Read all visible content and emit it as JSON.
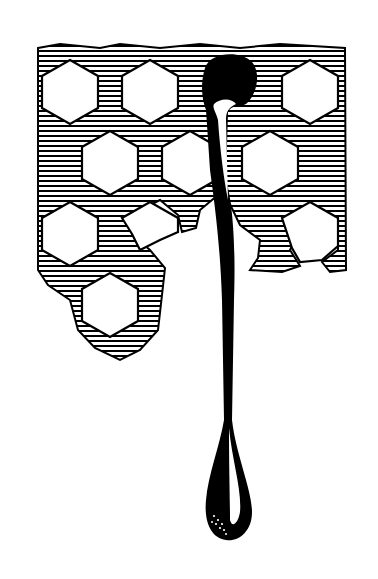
{
  "illustration": {
    "title": "Honeycomb with dripping drop",
    "subject": "hatched honeycomb grid with a black drop dripping down into a long teardrop",
    "colors": {
      "ink": "#000000",
      "paper": "#ffffff"
    },
    "cells": [
      {
        "row": 0,
        "cx": 70,
        "cy": 92
      },
      {
        "row": 0,
        "cx": 150,
        "cy": 92
      },
      {
        "row": 0,
        "cx": 310,
        "cy": 92
      },
      {
        "row": 1,
        "cx": 110,
        "cy": 163
      },
      {
        "row": 1,
        "cx": 190,
        "cy": 163
      },
      {
        "row": 1,
        "cx": 270,
        "cy": 163
      },
      {
        "row": 2,
        "cx": 70,
        "cy": 234
      },
      {
        "row": 3,
        "cx": 110,
        "cy": 305
      }
    ]
  }
}
